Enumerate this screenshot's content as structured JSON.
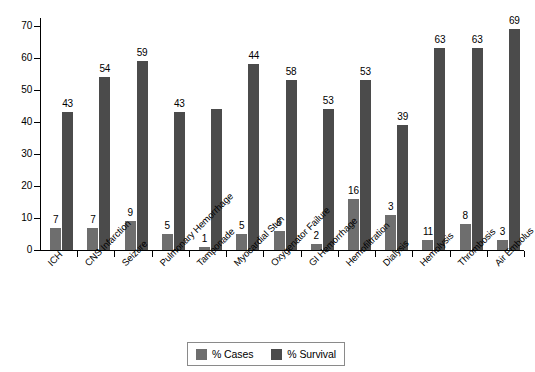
{
  "chart_data": {
    "type": "bar",
    "title": "",
    "subtitle": "",
    "xlabel": "",
    "ylabel": "",
    "ylim": [
      0,
      70
    ],
    "yticks": [
      0,
      10,
      20,
      30,
      40,
      50,
      60,
      70
    ],
    "grid": false,
    "legend_position": "bottom",
    "categories": [
      "ICH",
      "CNS Infarction",
      "Seizure",
      "Pulmonary Hemorrhage",
      "Tamponade",
      "Myocardial Stun",
      "Oxygenator Failure",
      "GI Hemorrhage",
      "Hemofiltration",
      "Dialysis",
      "Hemolysis",
      "Thrombosis",
      "Air Embolus"
    ],
    "series": [
      {
        "name": "% Cases",
        "color": "#6e6e6e",
        "values": [
          7,
          7,
          9,
          5,
          1,
          5,
          6,
          2,
          16,
          3,
          11,
          8,
          3
        ],
        "bar_heights": [
          7,
          7,
          9,
          5,
          1,
          5,
          6,
          2,
          16,
          11,
          3,
          8,
          3
        ]
      },
      {
        "name": "% Survival",
        "color": "#4b4b4b",
        "values": [
          43,
          54,
          59,
          43,
          null,
          44,
          58,
          53,
          53,
          39,
          63,
          63,
          69
        ],
        "bar_heights": [
          43,
          54,
          59,
          43,
          44,
          58,
          53,
          44,
          53,
          39,
          63,
          63,
          69
        ]
      }
    ]
  },
  "legend": {
    "items": [
      {
        "label": "% Cases",
        "color": "#6e6e6e"
      },
      {
        "label": "% Survival",
        "color": "#4b4b4b"
      }
    ]
  },
  "axis": {
    "y_tick_labels": [
      "0",
      "10",
      "20",
      "30",
      "40",
      "50",
      "60",
      "70"
    ]
  },
  "bars": [
    {
      "category": "ICH",
      "cases": 7,
      "cases_label": "7",
      "survival": 43,
      "survival_label": "43"
    },
    {
      "category": "CNS Infarction",
      "cases": 7,
      "cases_label": "7",
      "survival": 54,
      "survival_label": "54"
    },
    {
      "category": "Seizure",
      "cases": 9,
      "cases_label": "9",
      "survival": 59,
      "survival_label": "59"
    },
    {
      "category": "Pulmonary Hemorrhage",
      "cases": 5,
      "cases_label": "5",
      "survival": 43,
      "survival_label": "43"
    },
    {
      "category": "Tamponade",
      "cases": 1,
      "cases_label": "1",
      "survival": 44,
      "survival_label": ""
    },
    {
      "category": "Myocardial Stun",
      "cases": 5,
      "cases_label": "5",
      "survival": 58,
      "survival_label": "44"
    },
    {
      "category": "Oxygenator Failure",
      "cases": 6,
      "cases_label": "6",
      "survival": 53,
      "survival_label": "58"
    },
    {
      "category": "GI Hemorrhage",
      "cases": 2,
      "cases_label": "2",
      "survival": 44,
      "survival_label": "53"
    },
    {
      "category": "Hemofiltration",
      "cases": 16,
      "cases_label": "16",
      "survival": 53,
      "survival_label": "53"
    },
    {
      "category": "Dialysis",
      "cases": 11,
      "cases_label": "3",
      "survival": 39,
      "survival_label": "39"
    },
    {
      "category": "Hemolysis",
      "cases": 3,
      "cases_label": "11",
      "survival": 63,
      "survival_label": "63"
    },
    {
      "category": "Thrombosis",
      "cases": 8,
      "cases_label": "8",
      "survival": 63,
      "survival_label": "63"
    },
    {
      "category": "Air Embolus",
      "cases": 3,
      "cases_label": "3",
      "survival": 69,
      "survival_label": "69"
    }
  ]
}
